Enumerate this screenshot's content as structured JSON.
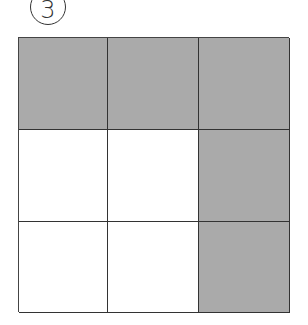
{
  "badge": {
    "label": "3"
  },
  "grid": {
    "rows": 3,
    "cols": 3,
    "shaded_color": "#aaaaaa",
    "unshaded_color": "#ffffff",
    "cells": [
      [
        true,
        true,
        true
      ],
      [
        false,
        false,
        true
      ],
      [
        false,
        false,
        true
      ]
    ]
  }
}
